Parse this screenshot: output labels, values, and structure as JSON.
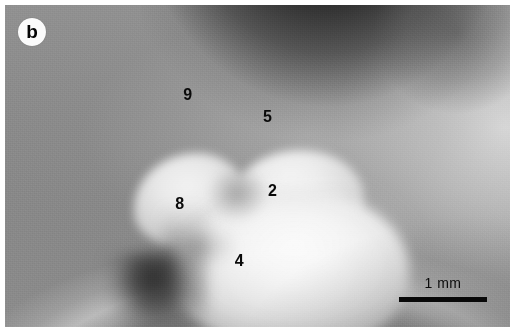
{
  "figure": {
    "panel_letter": "b",
    "type": "grayscale micrograph"
  },
  "annotations": {
    "cusps": [
      {
        "id": "cusp-9",
        "label": "9",
        "x_pct": 35.3,
        "y_pct": 25.4
      },
      {
        "id": "cusp-5",
        "label": "5",
        "x_pct": 51.1,
        "y_pct": 32.3
      },
      {
        "id": "cusp-2",
        "label": "2",
        "x_pct": 52.1,
        "y_pct": 55.4
      },
      {
        "id": "cusp-8",
        "label": "8",
        "x_pct": 33.7,
        "y_pct": 59.3
      },
      {
        "id": "cusp-4",
        "label": "4",
        "x_pct": 45.5,
        "y_pct": 77.0
      }
    ]
  },
  "scalebar": {
    "label": "1 mm",
    "length_px": 88,
    "thickness_px": 5,
    "color": "#090909"
  },
  "colors": {
    "plate_background": "#8c8c8c",
    "page_background": "#ffffff",
    "annotation_text": "#0a0a0a",
    "badge_fill": "#fbfbfb",
    "dark_field": "#222222",
    "bright_cusp": "#f4f4f4"
  }
}
